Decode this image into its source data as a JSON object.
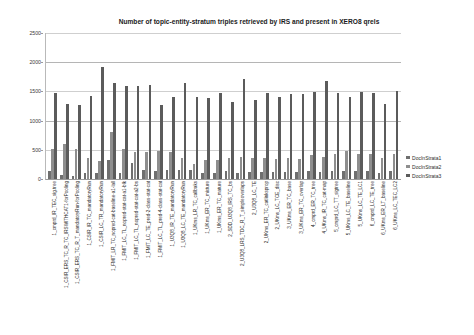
{
  "chart_data": {
    "type": "bar",
    "title": "Number of topic-entity-stratum triples retrieved by IRS and present in XERO8 qrels",
    "xlabel": "",
    "ylabel": "",
    "ylim": [
      0,
      2500
    ],
    "yticks": [
      0,
      500,
      1000,
      1500,
      2000,
      2500
    ],
    "ytick_labels": [
      "0",
      "500",
      "1000",
      "1500",
      "2000",
      "2500"
    ],
    "grid": true,
    "legend_position": "right",
    "legend": [
      "DocInStrata1",
      "DocInStrata2",
      "DocInStrata3"
    ],
    "colors": {
      "DocInStrata1": "#6f6f6f",
      "DocInStrata2": "#8e8e8e",
      "DocInStrata3": "#5b5b5b"
    },
    "categories": [
      "1_cmprd_IR_TEC_sig.tree",
      "1_CSIR_ERS_TC_R_TC_IRSWITHCAT1-forPooling",
      "1_CSIR_ERS_TC_R_T_mandatoryRun-forPooling",
      "1_CSIR_IR_TC_mandatoryRun",
      "1_CSIR_LC_TR_mandatoryRun",
      "1_FMIT_LR_TC_nopred-cat-baseline-a1-lall",
      "1_FMIT_LC_TL_nopred-stat-cat-a1-blk",
      "1_FMIT_LC_TL_nopred-stat-cat-a2-bs",
      "1_FMIT_LC_TE_pred-2-class-stat-cat",
      "1_FMIT_LC_TL_pred-4-class-stat-cat",
      "1_U3Q8_IR_TE_mandatoryRun",
      "1_U3Q8_LC_TE_mandatoryRun",
      "1_UKms_LR_TC_callbaks",
      "1_UKms_ER_TC_mixture",
      "1_UKms_ER_TC_mature",
      "2_SDD_U3Q8_IRS_TC_bs",
      "2_U3Q8_LRS_TDC_R_T_simpleoverlaps",
      "2_U3Q8_LC_TE",
      "2_UKms_ER_TC_catlinksprop",
      "2_UKms_LC_TCE_disc",
      "3_UKms_ER_TC_base",
      "3_UKms_ER_TC_overlap",
      "4_cmprd_ER_TC_tree",
      "4_UKms_IR_TC_cat-map",
      "5_cmprd_LC_TT_sigtree",
      "5_UKms_LC_TE_baseline",
      "5_UKms_LC_TE_LC1",
      "6_cmprd_LC_TE_tree",
      "6_UKms_ER_LT_baseline",
      "6_UKms_LC_TEC_LC2"
    ],
    "series": [
      {
        "name": "DocInStrata1",
        "values": [
          140,
          65,
          55,
          100,
          105,
          330,
          100,
          280,
          150,
          145,
          150,
          150,
          150,
          110,
          110,
          130,
          110,
          115,
          120,
          120,
          120,
          115,
          130,
          120,
          130,
          140,
          130,
          130,
          110,
          130
        ]
      },
      {
        "name": "DocInStrata2",
        "values": [
          510,
          600,
          520,
          360,
          310,
          800,
          515,
          470,
          460,
          475,
          455,
          355,
          250,
          330,
          330,
          355,
          380,
          355,
          360,
          345,
          355,
          345,
          415,
          370,
          420,
          480,
          430,
          425,
          360,
          430
        ]
      },
      {
        "name": "DocInStrata3",
        "values": [
          1465,
          1285,
          1270,
          1425,
          1915,
          1640,
          1595,
          1595,
          1605,
          1270,
          1410,
          1650,
          1405,
          1385,
          1465,
          1325,
          1710,
          1350,
          1465,
          1405,
          1450,
          1460,
          1490,
          1680,
          1480,
          1400,
          1490,
          1465,
          1285,
          1510
        ]
      }
    ]
  }
}
